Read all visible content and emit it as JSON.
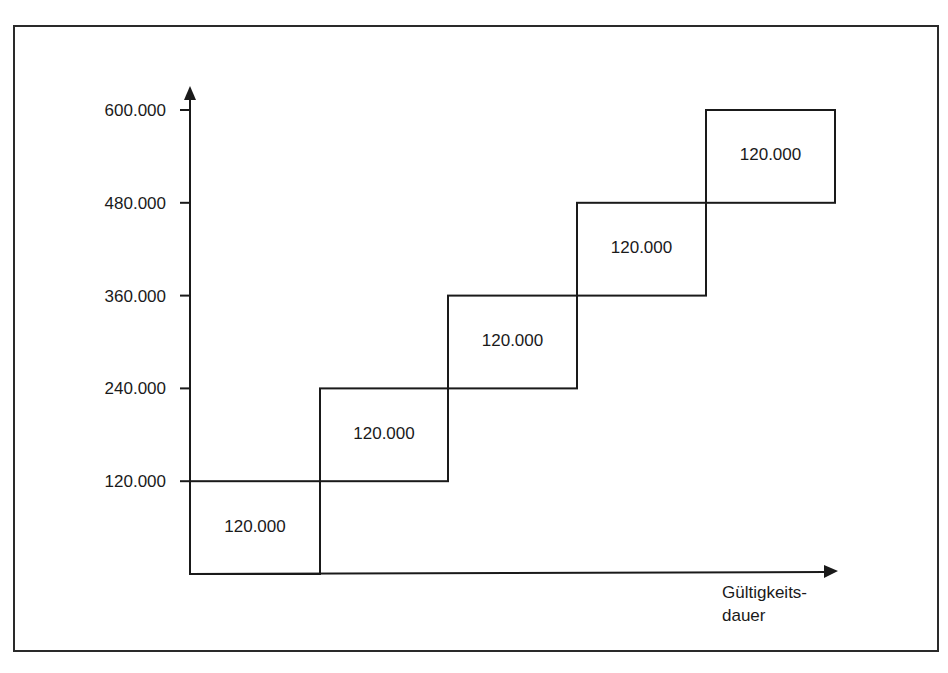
{
  "chart_data": {
    "type": "bar",
    "subtype": "stepped-cumulative",
    "title": "",
    "xlabel": "Gültigkeitsdauer",
    "xlabel_lines": [
      "Gültigkeits-",
      "dauer"
    ],
    "ylabel": "",
    "yticks": [
      "120.000",
      "240.000",
      "360.000",
      "480.000",
      "600.000"
    ],
    "ytick_values": [
      120000,
      240000,
      360000,
      480000,
      600000
    ],
    "ylim": [
      0,
      600000
    ],
    "grid": false,
    "legend": null,
    "categories": [
      "1",
      "2",
      "3",
      "4",
      "5"
    ],
    "series": [
      {
        "name": "Stufe",
        "bottoms": [
          0,
          120000,
          240000,
          360000,
          480000
        ],
        "values": [
          120000,
          120000,
          120000,
          120000,
          120000
        ],
        "labels": [
          "120.000",
          "120.000",
          "120.000",
          "120.000",
          "120.000"
        ]
      }
    ],
    "colors": {
      "line": "#1a1a1a",
      "background": "#ffffff"
    }
  }
}
